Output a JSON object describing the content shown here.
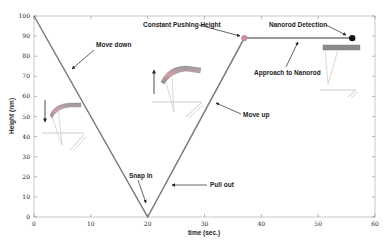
{
  "chart_data": {
    "type": "line",
    "title": "",
    "xlabel": "time (sec.)",
    "ylabel": "Height (nm)",
    "xlim": [
      0,
      60
    ],
    "ylim": [
      0,
      100
    ],
    "x_ticks": [
      0,
      10,
      20,
      30,
      40,
      50,
      60
    ],
    "x_tick_labels": [
      "0",
      "10",
      "20",
      "30",
      "40",
      "50",
      "60"
    ],
    "y_ticks": [
      0,
      10,
      20,
      30,
      40,
      50,
      60,
      70,
      80,
      90,
      100
    ],
    "y_tick_labels": [
      "0",
      "10",
      "20",
      "30",
      "40",
      "50",
      "60",
      "70",
      "80",
      "90",
      "100"
    ],
    "grid": false,
    "series": [
      {
        "name": "tip height",
        "x": [
          0,
          20,
          37,
          56
        ],
        "y": [
          100,
          0,
          89,
          89
        ],
        "color": "#7a7a7a"
      }
    ],
    "markers": [
      {
        "name": "Constant Pushing Height point",
        "x": 37,
        "y": 89,
        "color": "#d98a9a"
      },
      {
        "name": "Nanorod Detection point",
        "x": 56,
        "y": 89,
        "color": "#111111"
      }
    ],
    "annotations": [
      {
        "text": "Move down",
        "x": 6,
        "y": 76
      },
      {
        "text": "Snap In",
        "x": 20,
        "y": 5
      },
      {
        "text": "Pull out",
        "x": 23,
        "y": 15
      },
      {
        "text": "Move up",
        "x": 32,
        "y": 51
      },
      {
        "text": "Constant Pushing Height",
        "x": 37,
        "y": 89
      },
      {
        "text": "Approach to Nanorod",
        "x": 44,
        "y": 89
      },
      {
        "text": "Nanorod Detection",
        "x": 56,
        "y": 89
      }
    ]
  },
  "labels": {
    "xlabel": "time (sec.)",
    "ylabel": "Height (nm)",
    "move_down": "Move down",
    "snap_in": "Snap In",
    "pull_out": "Pull out",
    "move_up": "Move up",
    "constant_pushing_height": "Constant Pushing Height",
    "approach": "Approach to Nanorod",
    "nanorod_detection": "Nanorod Detection"
  },
  "ticks": {
    "x": [
      "0",
      "10",
      "20",
      "30",
      "40",
      "50",
      "60"
    ],
    "y": [
      "0",
      "10",
      "20",
      "30",
      "40",
      "50",
      "60",
      "70",
      "80",
      "90",
      "100"
    ]
  }
}
